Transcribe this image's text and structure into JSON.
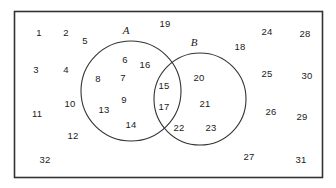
{
  "diagram": {
    "type": "venn-diagram",
    "title": "",
    "universe": {
      "shape": "rectangle",
      "stroke_color": "#333333",
      "fill_color": "#ffffff",
      "x": 14,
      "y": 11,
      "width": 309,
      "height": 167
    },
    "sets": [
      {
        "label": "A",
        "label_x": 126,
        "label_y": 30,
        "cx": 131,
        "cy": 91,
        "r": 50,
        "stroke_color": "#333333"
      },
      {
        "label": "B",
        "label_x": 194,
        "label_y": 42,
        "cx": 200,
        "cy": 99,
        "r": 46,
        "stroke_color": "#333333"
      }
    ],
    "elements": [
      {
        "value": "1",
        "x": 39,
        "y": 33,
        "region": "outside"
      },
      {
        "value": "2",
        "x": 66,
        "y": 33,
        "region": "outside"
      },
      {
        "value": "5",
        "x": 85,
        "y": 41,
        "region": "outside"
      },
      {
        "value": "19",
        "x": 165,
        "y": 24,
        "region": "outside"
      },
      {
        "value": "24",
        "x": 267,
        "y": 32,
        "region": "outside"
      },
      {
        "value": "28",
        "x": 305,
        "y": 34,
        "region": "outside"
      },
      {
        "value": "18",
        "x": 240,
        "y": 47,
        "region": "outside"
      },
      {
        "value": "3",
        "x": 36,
        "y": 70,
        "region": "outside"
      },
      {
        "value": "4",
        "x": 66,
        "y": 70,
        "region": "outside"
      },
      {
        "value": "25",
        "x": 267,
        "y": 74,
        "region": "outside"
      },
      {
        "value": "30",
        "x": 307,
        "y": 76,
        "region": "outside"
      },
      {
        "value": "11",
        "x": 37,
        "y": 114,
        "region": "outside"
      },
      {
        "value": "10",
        "x": 70,
        "y": 104,
        "region": "outside"
      },
      {
        "value": "26",
        "x": 271,
        "y": 112,
        "region": "outside"
      },
      {
        "value": "29",
        "x": 302,
        "y": 117,
        "region": "outside"
      },
      {
        "value": "12",
        "x": 73,
        "y": 136,
        "region": "outside"
      },
      {
        "value": "32",
        "x": 45,
        "y": 160,
        "region": "outside"
      },
      {
        "value": "27",
        "x": 249,
        "y": 157,
        "region": "outside"
      },
      {
        "value": "31",
        "x": 301,
        "y": 160,
        "region": "outside"
      },
      {
        "value": "6",
        "x": 125,
        "y": 60,
        "region": "A-only"
      },
      {
        "value": "16",
        "x": 145,
        "y": 65,
        "region": "A-only"
      },
      {
        "value": "8",
        "x": 98,
        "y": 79,
        "region": "A-only"
      },
      {
        "value": "7",
        "x": 123,
        "y": 78,
        "region": "A-only"
      },
      {
        "value": "9",
        "x": 124,
        "y": 100,
        "region": "A-only"
      },
      {
        "value": "13",
        "x": 104,
        "y": 110,
        "region": "A-only"
      },
      {
        "value": "14",
        "x": 131,
        "y": 125,
        "region": "A-only"
      },
      {
        "value": "15",
        "x": 164,
        "y": 86,
        "region": "A-and-B"
      },
      {
        "value": "17",
        "x": 164,
        "y": 107,
        "region": "A-and-B"
      },
      {
        "value": "20",
        "x": 199,
        "y": 78,
        "region": "B-only"
      },
      {
        "value": "21",
        "x": 205,
        "y": 104,
        "region": "B-only"
      },
      {
        "value": "22",
        "x": 179,
        "y": 128,
        "region": "B-only"
      },
      {
        "value": "23",
        "x": 211,
        "y": 128,
        "region": "B-only"
      }
    ]
  }
}
